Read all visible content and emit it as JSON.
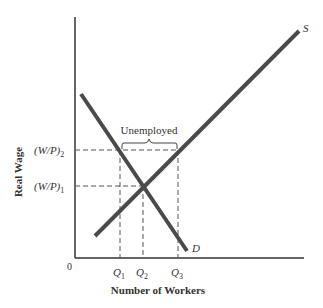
{
  "diagram": {
    "title": "",
    "axes": {
      "x_label": "Number of Workers",
      "y_label": "Real Wage",
      "origin_label": "0"
    },
    "curves": [
      {
        "name": "supply",
        "label": "S",
        "color": "#4a4a4a"
      },
      {
        "name": "demand",
        "label": "D",
        "color": "#4a4a4a"
      }
    ],
    "y_ticks": [
      {
        "id": "wp2",
        "base": "(W/P)",
        "sub": "2"
      },
      {
        "id": "wp1",
        "base": "(W/P)",
        "sub": "1"
      }
    ],
    "x_ticks": [
      {
        "id": "q1",
        "base": "Q",
        "sub": "1"
      },
      {
        "id": "q2",
        "base": "Q",
        "sub": "2"
      },
      {
        "id": "q3",
        "base": "Q",
        "sub": "3"
      }
    ],
    "annotation": {
      "label": "Unemployed"
    },
    "colors": {
      "axis": "#333333",
      "curve": "#4a4a4a",
      "dashed": "#555555",
      "text": "#333333"
    }
  }
}
